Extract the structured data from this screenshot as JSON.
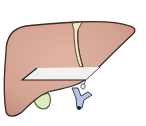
{
  "illustration": {
    "subject": "Liver (anterior view)",
    "parts": {
      "liver": {
        "label": "Liver",
        "fill": "#d8a898",
        "outline": "#3b2a2a"
      },
      "falciform_ligament": {
        "label": "Falciform ligament",
        "fill": "#efe9c8"
      },
      "cut_band": {
        "label": "Transverse section band",
        "fill": "#f4f4f4"
      },
      "gallbladder": {
        "label": "Gallbladder",
        "fill": "#dcecc0",
        "outline": "#4a6b33"
      },
      "vessel": {
        "label": "Hepatic vessel",
        "fill": "#b9c3e6",
        "outline": "#2b2b3a"
      }
    }
  }
}
